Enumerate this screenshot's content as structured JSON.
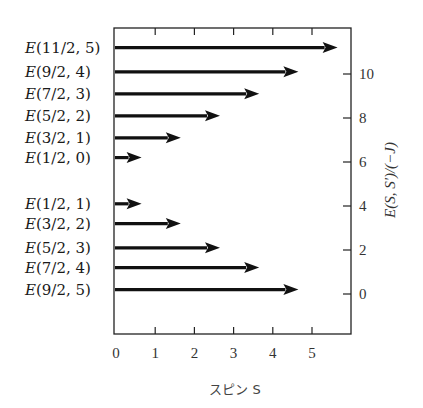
{
  "chart_data": {
    "type": "bar",
    "orientation": "horizontal-arrows",
    "title": "",
    "xlabel": "スピン S",
    "ylabel": "E(S, S')/(−J)",
    "xlim": [
      0,
      6
    ],
    "ylim": [
      -1.6,
      11.9
    ],
    "x_ticks": [
      0,
      1,
      2,
      3,
      4,
      5
    ],
    "x_tick_labels": [
      "0",
      "1",
      "2",
      "3",
      "4",
      "5"
    ],
    "y_ticks": [
      0,
      2,
      4,
      6,
      8,
      10
    ],
    "y_tick_labels": [
      "0",
      "2",
      "4",
      "6",
      "8",
      "10"
    ],
    "y_axis_side": "right",
    "grid": false,
    "series": [
      {
        "name": "E(11/2, 5)",
        "label_prefix": "E",
        "args": "(11/2, 5)",
        "S": 5.5,
        "energy": 11.2
      },
      {
        "name": "E(9/2, 4)",
        "label_prefix": "E",
        "args": "(9/2, 4)",
        "S": 4.5,
        "energy": 10.1
      },
      {
        "name": "E(7/2, 3)",
        "label_prefix": "E",
        "args": "(7/2, 3)",
        "S": 3.5,
        "energy": 9.1
      },
      {
        "name": "E(5/2, 2)",
        "label_prefix": "E",
        "args": "(5/2, 2)",
        "S": 2.5,
        "energy": 8.1
      },
      {
        "name": "E(3/2, 1)",
        "label_prefix": "E",
        "args": "(3/2, 1)",
        "S": 1.5,
        "energy": 7.1
      },
      {
        "name": "E(1/2, 0)",
        "label_prefix": "E",
        "args": "(1/2, 0)",
        "S": 0.5,
        "energy": 6.2
      },
      {
        "name": "E(1/2, 1)",
        "label_prefix": "E",
        "args": "(1/2, 1)",
        "S": 0.5,
        "energy": 4.1
      },
      {
        "name": "E(3/2, 2)",
        "label_prefix": "E",
        "args": "(3/2, 2)",
        "S": 1.5,
        "energy": 3.2
      },
      {
        "name": "E(5/2, 3)",
        "label_prefix": "E",
        "args": "(5/2, 3)",
        "S": 2.5,
        "energy": 2.1
      },
      {
        "name": "E(7/2, 4)",
        "label_prefix": "E",
        "args": "(7/2, 4)",
        "S": 3.5,
        "energy": 1.2
      },
      {
        "name": "E(9/2, 5)",
        "label_prefix": "E",
        "args": "(9/2, 5)",
        "S": 4.5,
        "energy": 0.2
      }
    ],
    "colors": {
      "ink": "#111111",
      "axis": "#222222",
      "text": "#333333"
    }
  }
}
